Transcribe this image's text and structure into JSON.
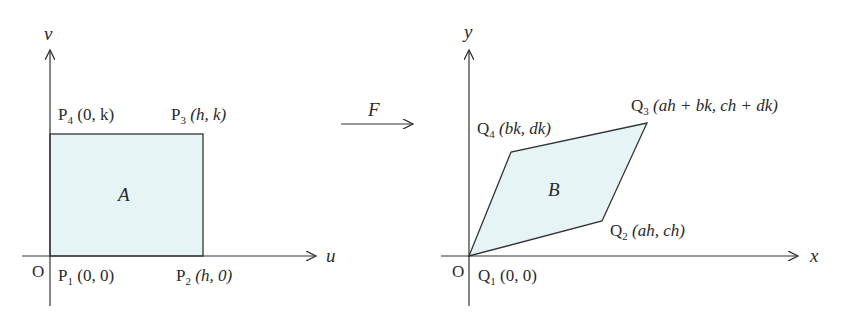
{
  "colors": {
    "region_fill": "#e6f4f6",
    "stroke": "#333333"
  },
  "left_diagram": {
    "axes": {
      "horizontal": "u",
      "vertical": "v",
      "origin": "O"
    },
    "region_label": "A",
    "points": [
      {
        "name": "P",
        "sub": "1",
        "coords": "(0, 0)"
      },
      {
        "name": "P",
        "sub": "2",
        "coords": "(h, 0)"
      },
      {
        "name": "P",
        "sub": "3",
        "coords": "(h, k)"
      },
      {
        "name": "P",
        "sub": "4",
        "coords": "(0, k)"
      }
    ]
  },
  "mapping": {
    "label": "F"
  },
  "right_diagram": {
    "axes": {
      "horizontal": "x",
      "vertical": "y",
      "origin": "O"
    },
    "region_label": "B",
    "points": [
      {
        "name": "Q",
        "sub": "1",
        "coords": "(0, 0)"
      },
      {
        "name": "Q",
        "sub": "2",
        "coords": "(ah, ch)"
      },
      {
        "name": "Q",
        "sub": "3",
        "coords": "(ah + bk, ch + dk)"
      },
      {
        "name": "Q",
        "sub": "4",
        "coords": "(bk, dk)"
      }
    ]
  }
}
